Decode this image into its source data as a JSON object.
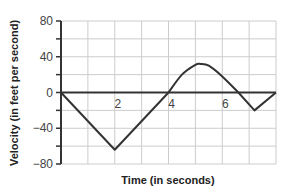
{
  "chart_data": {
    "type": "line",
    "title": "",
    "xlabel": "Time (in seconds)",
    "ylabel": "Velocity (in feet per second)",
    "xlim": [
      0,
      8
    ],
    "ylim": [
      -80,
      80
    ],
    "x_ticks_labeled": [
      "2",
      "4",
      "6"
    ],
    "y_ticks_labeled": [
      "80",
      "40",
      "0",
      "−40",
      "−80"
    ],
    "x_grid_step": 1,
    "y_grid_step": 20,
    "grid": true,
    "legend": null,
    "series": [
      {
        "name": "velocity",
        "x": [
          0,
          2,
          4,
          4.5,
          5,
          5.2,
          5.5,
          6,
          6.6,
          7.2,
          8
        ],
        "y": [
          0,
          -64,
          0,
          20,
          31,
          32,
          30,
          18,
          0,
          -20,
          0
        ]
      }
    ],
    "colors": {
      "line": "#333333",
      "grid": "#cccccc",
      "axis": "#333333"
    }
  }
}
